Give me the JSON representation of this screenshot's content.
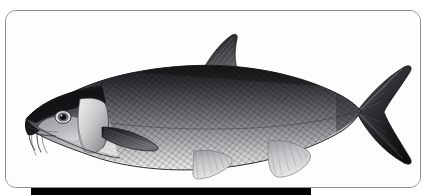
{
  "figure": {
    "kind": "scientific-illustration",
    "medium": "black-and-white engraving",
    "alt_text": "Black and white engraving of a barbel fish shown in left-facing lateral profile, with scaled body, pointed dorsal fin, deeply forked tail and two pairs of barbels at the mouth",
    "caption": "",
    "frame": {
      "shape": "rounded-rectangle",
      "border_color": "#8e8e92",
      "fill_color": "#ffffff",
      "corner_radius_px": 11
    },
    "caption_bar": {
      "color": "#000000",
      "label": ""
    }
  },
  "palette": {
    "background": "#ffffff",
    "plate_fill": "#fdfdfd",
    "frame_border": "#8e8e92",
    "ink_darkest": "#18181a",
    "ink_dark": "#2e2e31",
    "ink_mid": "#646469",
    "ink_light": "#a9a9ad",
    "ink_pale": "#d6d6d8",
    "bar": "#000000"
  },
  "anatomy": {
    "parts": [
      {
        "id": "snout",
        "label": "Snout"
      },
      {
        "id": "barbels",
        "label": "Barbels"
      },
      {
        "id": "eye",
        "label": "Eye"
      },
      {
        "id": "operculum",
        "label": "Gill cover"
      },
      {
        "id": "body",
        "label": "Scaled body"
      },
      {
        "id": "lateral-line",
        "label": "Lateral line"
      },
      {
        "id": "dorsal-fin",
        "label": "Dorsal fin"
      },
      {
        "id": "pectoral-fin",
        "label": "Pectoral fin"
      },
      {
        "id": "pelvic-fin",
        "label": "Pelvic fin"
      },
      {
        "id": "anal-fin",
        "label": "Anal fin"
      },
      {
        "id": "caudal-fin",
        "label": "Caudal fin"
      }
    ]
  }
}
